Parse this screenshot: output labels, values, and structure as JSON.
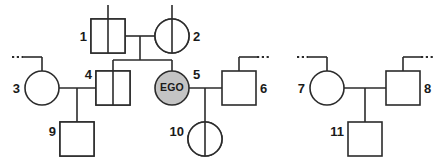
{
  "diagram": {
    "type": "pedigree-chart",
    "proband_label": "EGO",
    "colors": {
      "line": "#2b2b2b",
      "shading": "#c9c9c9",
      "background": "#ffffff"
    },
    "individuals": [
      {
        "id": "1",
        "label": "1",
        "shape": "square",
        "sex": "male",
        "shading": "left-half",
        "affected": true
      },
      {
        "id": "2",
        "label": "2",
        "shape": "circle",
        "sex": "female",
        "shading": "left-half",
        "affected": true
      },
      {
        "id": "3",
        "label": "3",
        "shape": "circle",
        "sex": "female",
        "shading": "none",
        "affected": false
      },
      {
        "id": "4",
        "label": "4",
        "shape": "square",
        "sex": "male",
        "shading": "left-half",
        "affected": true
      },
      {
        "id": "5",
        "label": "5",
        "shape": "circle",
        "sex": "female",
        "shading": "full",
        "affected": true,
        "proband": true,
        "inner_text": "EGO"
      },
      {
        "id": "6",
        "label": "6",
        "shape": "square",
        "sex": "male",
        "shading": "none",
        "affected": false
      },
      {
        "id": "7",
        "label": "7",
        "shape": "circle",
        "sex": "female",
        "shading": "none",
        "affected": false
      },
      {
        "id": "8",
        "label": "8",
        "shape": "square",
        "sex": "male",
        "shading": "none",
        "affected": false
      },
      {
        "id": "9",
        "label": "9",
        "shape": "square",
        "sex": "male",
        "shading": "upper-left-quadrant",
        "affected": true
      },
      {
        "id": "10",
        "label": "10",
        "shape": "circle",
        "sex": "female",
        "shading": "left-half",
        "affected": true
      },
      {
        "id": "11",
        "label": "11",
        "shape": "square",
        "sex": "male",
        "shading": "none",
        "affected": false
      }
    ],
    "unions": [
      {
        "partners": [
          "1",
          "2"
        ],
        "children": [
          "4",
          "5"
        ]
      },
      {
        "partners": [
          "3",
          "4"
        ],
        "children": [
          "9"
        ]
      },
      {
        "partners": [
          "5",
          "6"
        ],
        "children": [
          "10"
        ]
      },
      {
        "partners": [
          "7",
          "8"
        ],
        "children": [
          "11"
        ]
      }
    ],
    "continuation_marks": [
      {
        "near": "1",
        "direction": "up"
      },
      {
        "near": "2",
        "direction": "up"
      },
      {
        "near": "3",
        "direction": "left"
      },
      {
        "near": "6",
        "direction": "right"
      },
      {
        "near": "7",
        "direction": "left"
      },
      {
        "near": "8",
        "direction": "right"
      }
    ]
  }
}
